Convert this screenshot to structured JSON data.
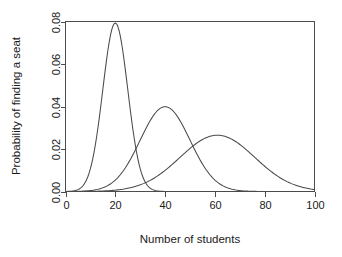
{
  "chart_data": {
    "type": "line",
    "title": "",
    "subtitle": "",
    "xlabel": "Number of students",
    "ylabel": "Probability of finding a seat",
    "xlim": [
      0,
      100
    ],
    "ylim": [
      0,
      0.08
    ],
    "xticks": [
      0,
      20,
      40,
      60,
      80,
      100
    ],
    "xticklabels": [
      "0",
      "20",
      "40",
      "60",
      "80",
      "100"
    ],
    "yticks": [
      0.0,
      0.02,
      0.04,
      0.06,
      0.08
    ],
    "yticklabels": [
      "0.00",
      "0.02",
      "0.04",
      "0.06",
      "0.08"
    ],
    "grid": false,
    "legend": false,
    "legend_position": "none",
    "box": "full",
    "line_color": "#4a4a4a",
    "background_color": "#ffffff",
    "series": [
      {
        "name": "curve-1",
        "peak_x": 20,
        "peak_y": 0.0793,
        "sigma": 5.0,
        "x": [
          0,
          2,
          4,
          6,
          8,
          10,
          12,
          14,
          16,
          18,
          20,
          22,
          24,
          26,
          28,
          30,
          32,
          34,
          36,
          38,
          40,
          45,
          50,
          60,
          70,
          80,
          90,
          100
        ],
        "values": [
          0.0002,
          0.0006,
          0.0015,
          0.0035,
          0.0072,
          0.0134,
          0.0223,
          0.0335,
          0.0456,
          0.0564,
          0.0634,
          0.0644,
          0.0592,
          0.0494,
          0.0373,
          0.0254,
          0.0156,
          0.0086,
          0.0043,
          0.0019,
          0.0008,
          0.0001,
          0.0,
          0.0,
          0.0,
          0.0,
          0.0,
          0.0
        ]
      },
      {
        "name": "curve-2",
        "peak_x": 40,
        "peak_y": 0.0399,
        "sigma": 10.0,
        "x": [
          0,
          5,
          10,
          15,
          20,
          25,
          30,
          35,
          40,
          45,
          50,
          55,
          60,
          65,
          70,
          75,
          80,
          85,
          90,
          95,
          100
        ],
        "values": [
          0.0001,
          0.0004,
          0.0014,
          0.0044,
          0.0108,
          0.0216,
          0.0352,
          0.047,
          0.0513,
          0.047,
          0.0352,
          0.0216,
          0.0108,
          0.0044,
          0.0014,
          0.0004,
          0.0001,
          0.0,
          0.0,
          0.0,
          0.0
        ]
      },
      {
        "name": "curve-3",
        "peak_x": 61,
        "peak_y": 0.0265,
        "sigma": 15.0,
        "x": [
          0,
          5,
          10,
          15,
          20,
          25,
          30,
          35,
          40,
          45,
          50,
          55,
          60,
          65,
          70,
          75,
          80,
          85,
          90,
          95,
          100
        ],
        "values": [
          0.0,
          0.0001,
          0.0002,
          0.0006,
          0.0014,
          0.003,
          0.0057,
          0.0096,
          0.0146,
          0.0199,
          0.0242,
          0.0263,
          0.0258,
          0.0228,
          0.0182,
          0.0131,
          0.0085,
          0.005,
          0.0026,
          0.0012,
          0.0005
        ]
      }
    ]
  }
}
